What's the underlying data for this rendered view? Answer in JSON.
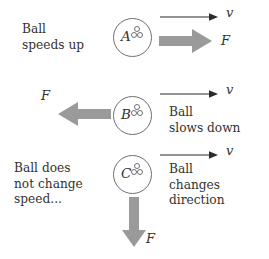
{
  "figure": {
    "type": "physics-force-velocity-diagram",
    "background_color": "#ffffff",
    "force_arrow_color": "#9a9a9a",
    "velocity_arrow_color": "#2b2b2b",
    "ball_outline_color": "#6f6f6f",
    "text_color": "#33322f"
  },
  "rows": [
    {
      "id": "A",
      "ball_label": "A",
      "left_text": "Ball\nspeeds up",
      "right_text": "",
      "velocity_label": "v",
      "velocity_direction": "right",
      "force_label": "F",
      "force_direction": "right"
    },
    {
      "id": "B",
      "ball_label": "B",
      "left_text": "",
      "right_text": "Ball\nslows down",
      "velocity_label": "v",
      "velocity_direction": "right",
      "force_label": "F",
      "force_direction": "left"
    },
    {
      "id": "C",
      "ball_label": "C",
      "left_text": "Ball does\nnot change\nspeed...",
      "right_text": "Ball\nchanges\ndirection",
      "velocity_label": "v",
      "velocity_direction": "right",
      "force_label": "F",
      "force_direction": "down"
    }
  ]
}
